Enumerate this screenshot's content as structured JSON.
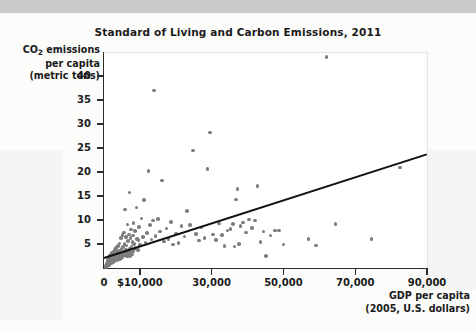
{
  "figure": {
    "title": "Standard of Living and Carbon Emissions, 2011",
    "y_axis_title_line1": "CO",
    "y_axis_title_sub": "2",
    "y_axis_title_line1b": " emissions",
    "y_axis_title_line2": "per capita",
    "y_axis_title_line3": "(metric tons)",
    "x_axis_title_line1": "GDP per capita",
    "x_axis_title_line2": "(2005, U.S. dollars)"
  },
  "colors": {
    "point": "#7d7d7d",
    "trendline": "#111111",
    "axis": "#2b2b2b",
    "text": "#1a1a1a",
    "plot_background": "#ffffff",
    "page_background": "#fcfcfb",
    "top_band": "#c9c9c9"
  },
  "chart_data": {
    "type": "scatter",
    "title": "Standard of Living and Carbon Emissions, 2011",
    "xlabel": "GDP per capita (2005, U.S. dollars)",
    "ylabel": "CO2 emissions per capita (metric tons)",
    "xlim": [
      0,
      90000
    ],
    "ylim": [
      0,
      45
    ],
    "grid": false,
    "legend": null,
    "x_ticks": [
      0,
      10000,
      30000,
      50000,
      70000,
      90000
    ],
    "x_tick_labels": [
      "0",
      "$10,000",
      "30,000",
      "50,000",
      "70,000",
      "90,000"
    ],
    "y_ticks": [
      5,
      10,
      15,
      20,
      25,
      30,
      35,
      40
    ],
    "y_tick_labels": [
      "5",
      "10",
      "15",
      "20",
      "25",
      "30",
      "35",
      "40"
    ],
    "trendline": {
      "type": "linear-fit",
      "x_start": 0,
      "y_start": 2.2,
      "x_end": 90000,
      "y_end": 23.8
    },
    "points": [
      [
        400,
        0.3
      ],
      [
        500,
        0.2
      ],
      [
        600,
        0.5
      ],
      [
        700,
        0.3
      ],
      [
        800,
        0.6
      ],
      [
        850,
        0.9
      ],
      [
        900,
        0.4
      ],
      [
        950,
        1.1
      ],
      [
        1000,
        0.7
      ],
      [
        1050,
        1.4
      ],
      [
        1100,
        0.5
      ],
      [
        1150,
        1.8
      ],
      [
        1200,
        0.9
      ],
      [
        1250,
        1.2
      ],
      [
        1300,
        2.0
      ],
      [
        1350,
        0.6
      ],
      [
        1400,
        1.5
      ],
      [
        1450,
        1.0
      ],
      [
        1500,
        2.3
      ],
      [
        1550,
        0.8
      ],
      [
        1600,
        1.7
      ],
      [
        1650,
        1.1
      ],
      [
        1700,
        2.6
      ],
      [
        1750,
        1.3
      ],
      [
        1800,
        0.9
      ],
      [
        1850,
        2.1
      ],
      [
        1900,
        1.6
      ],
      [
        1950,
        1.2
      ],
      [
        2000,
        2.8
      ],
      [
        2050,
        1.0
      ],
      [
        2100,
        1.9
      ],
      [
        2150,
        2.4
      ],
      [
        2200,
        1.4
      ],
      [
        2250,
        3.1
      ],
      [
        2300,
        1.7
      ],
      [
        2400,
        2.2
      ],
      [
        2500,
        1.3
      ],
      [
        2600,
        3.4
      ],
      [
        2700,
        1.9
      ],
      [
        2800,
        2.6
      ],
      [
        2900,
        1.5
      ],
      [
        3000,
        3.8
      ],
      [
        3100,
        2.1
      ],
      [
        3200,
        2.9
      ],
      [
        3300,
        1.8
      ],
      [
        3400,
        4.2
      ],
      [
        3500,
        2.4
      ],
      [
        3600,
        3.3
      ],
      [
        3700,
        2.0
      ],
      [
        3800,
        1.6
      ],
      [
        3900,
        4.6
      ],
      [
        4000,
        2.7
      ],
      [
        4100,
        3.6
      ],
      [
        4200,
        2.2
      ],
      [
        4300,
        5.1
      ],
      [
        4400,
        1.9
      ],
      [
        4500,
        3.0
      ],
      [
        4600,
        2.5
      ],
      [
        4700,
        6.3
      ],
      [
        4800,
        2.1
      ],
      [
        4900,
        3.9
      ],
      [
        5000,
        2.8
      ],
      [
        5100,
        6.9
      ],
      [
        5200,
        2.3
      ],
      [
        5300,
        4.4
      ],
      [
        5400,
        3.2
      ],
      [
        5500,
        7.4
      ],
      [
        5600,
        2.6
      ],
      [
        5700,
        5.0
      ],
      [
        5800,
        3.5
      ],
      [
        5900,
        12.2
      ],
      [
        6000,
        2.9
      ],
      [
        6100,
        6.5
      ],
      [
        6200,
        3.8
      ],
      [
        6300,
        4.7
      ],
      [
        6400,
        2.4
      ],
      [
        6500,
        9.1
      ],
      [
        6600,
        3.3
      ],
      [
        6700,
        5.6
      ],
      [
        6800,
        2.7
      ],
      [
        6900,
        7.0
      ],
      [
        7000,
        3.6
      ],
      [
        7100,
        15.7
      ],
      [
        7200,
        4.1
      ],
      [
        7300,
        2.5
      ],
      [
        7400,
        6.2
      ],
      [
        7500,
        3.1
      ],
      [
        7600,
        8.0
      ],
      [
        7700,
        4.5
      ],
      [
        7800,
        2.8
      ],
      [
        7900,
        5.4
      ],
      [
        8000,
        3.4
      ],
      [
        8100,
        6.8
      ],
      [
        8200,
        9.4
      ],
      [
        8300,
        3.9
      ],
      [
        8400,
        5.0
      ],
      [
        8600,
        7.7
      ],
      [
        8800,
        4.3
      ],
      [
        9000,
        12.6
      ],
      [
        9200,
        6.0
      ],
      [
        9400,
        3.7
      ],
      [
        9600,
        5.8
      ],
      [
        9800,
        8.6
      ],
      [
        10000,
        4.8
      ],
      [
        10400,
        10.3
      ],
      [
        10800,
        6.4
      ],
      [
        11200,
        14.2
      ],
      [
        11600,
        5.3
      ],
      [
        12000,
        7.3
      ],
      [
        12400,
        20.2
      ],
      [
        12800,
        8.9
      ],
      [
        13200,
        5.9
      ],
      [
        13600,
        9.9
      ],
      [
        14000,
        37.0
      ],
      [
        14400,
        6.7
      ],
      [
        15000,
        10.2
      ],
      [
        15600,
        7.6
      ],
      [
        16200,
        18.2
      ],
      [
        16800,
        5.5
      ],
      [
        17400,
        8.2
      ],
      [
        18000,
        6.1
      ],
      [
        18600,
        9.6
      ],
      [
        19200,
        4.9
      ],
      [
        20000,
        7.2
      ],
      [
        20800,
        5.2
      ],
      [
        21600,
        8.7
      ],
      [
        22400,
        6.6
      ],
      [
        23200,
        11.9
      ],
      [
        24000,
        9.0
      ],
      [
        24800,
        24.5
      ],
      [
        25600,
        7.1
      ],
      [
        26400,
        5.7
      ],
      [
        27200,
        8.4
      ],
      [
        28000,
        6.3
      ],
      [
        28800,
        20.6
      ],
      [
        29600,
        28.2
      ],
      [
        30400,
        7.0
      ],
      [
        31200,
        5.8
      ],
      [
        32000,
        9.3
      ],
      [
        32800,
        6.9
      ],
      [
        33600,
        4.6
      ],
      [
        34400,
        7.8
      ],
      [
        35200,
        8.1
      ],
      [
        36000,
        9.2
      ],
      [
        36400,
        4.5
      ],
      [
        36800,
        14.3
      ],
      [
        37200,
        16.5
      ],
      [
        37600,
        5.0
      ],
      [
        38000,
        8.8
      ],
      [
        38800,
        9.5
      ],
      [
        39600,
        7.4
      ],
      [
        40400,
        10.1
      ],
      [
        41200,
        8.3
      ],
      [
        42000,
        9.9
      ],
      [
        42800,
        17.1
      ],
      [
        43600,
        5.4
      ],
      [
        44400,
        7.6
      ],
      [
        45200,
        2.5
      ],
      [
        46400,
        6.8
      ],
      [
        47600,
        7.8
      ],
      [
        48800,
        7.8
      ],
      [
        50000,
        4.9
      ],
      [
        57000,
        6.0
      ],
      [
        59000,
        4.7
      ],
      [
        62000,
        43.9
      ],
      [
        64500,
        9.2
      ],
      [
        74500,
        6.1
      ],
      [
        82500,
        20.9
      ]
    ]
  }
}
